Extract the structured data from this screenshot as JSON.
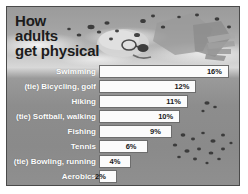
{
  "title": {
    "line1": "How",
    "line2": "adults",
    "line3": "get physical"
  },
  "background": {
    "image_name": "swimmer-photo",
    "description": "grayscale photo of a swimmer in goggles with water splash"
  },
  "colors": {
    "frame_border": "#4a4a4a",
    "page_background": "#ffffff",
    "panel_background": "#8f8f8f",
    "bar_fill": "#fbfbfb",
    "bar_border": "#6d6d6d",
    "label_text": "#ffffff",
    "value_text": "#1a1a1a",
    "title_text": "#1c1c1c"
  },
  "chart_data": {
    "type": "bar",
    "title": "How adults get physical",
    "xlabel": "",
    "ylabel": "",
    "xlim": [
      0,
      17
    ],
    "orientation": "horizontal",
    "grid": false,
    "legend": "none",
    "value_suffix": "%",
    "categories": [
      "Swimming",
      "(tie) Bicycling, golf",
      "Hiking",
      "(tie) Softball, walking",
      "Fishing",
      "Tennis",
      "(tie) Bowling, running",
      "Aerobics"
    ],
    "values": [
      16,
      12,
      11,
      10,
      9,
      6,
      4,
      2
    ],
    "labels": [
      "16%",
      "12%",
      "11%",
      "10%",
      "9%",
      "6%",
      "4%",
      "2%"
    ]
  }
}
